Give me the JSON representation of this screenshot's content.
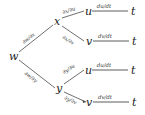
{
  "diagram": {
    "type": "chain-rule-tree",
    "root": {
      "label": "w"
    },
    "level1": [
      {
        "label": "x",
        "edge_label": "∂w/∂x"
      },
      {
        "label": "y",
        "edge_label": "∂w/∂y"
      }
    ],
    "level2": [
      {
        "label": "u",
        "edge_label": "∂x/∂u",
        "parent": "x"
      },
      {
        "label": "v",
        "edge_label": "∂x/∂v",
        "parent": "x"
      },
      {
        "label": "u",
        "edge_label": "∂y/∂u",
        "parent": "y"
      },
      {
        "label": "v",
        "edge_label": "∂y/∂v",
        "parent": "y"
      }
    ],
    "level3": [
      {
        "label": "t",
        "edge_label": "du/dt",
        "parent": "u"
      },
      {
        "label": "t",
        "edge_label": "dv/dt",
        "parent": "v"
      },
      {
        "label": "t",
        "edge_label": "du/dt",
        "parent": "u"
      },
      {
        "label": "t",
        "edge_label": "dv/dt",
        "parent": "v"
      }
    ],
    "colors": {
      "line": "#4a4a4a",
      "node_text": "#1a1a1a",
      "label_text": "#3a3a3a",
      "background": "#ffffff"
    }
  }
}
